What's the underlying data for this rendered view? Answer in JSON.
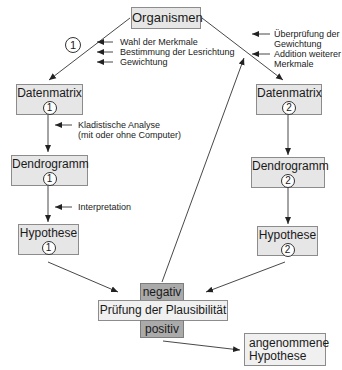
{
  "boxes": {
    "organismen": "Organismen",
    "datenmatrix1": {
      "label": "Datenmatrix",
      "num": "1"
    },
    "datenmatrix2": {
      "label": "Datenmatrix",
      "num": "2"
    },
    "dendrogramm1": {
      "label": "Dendrogramm",
      "num": "1"
    },
    "dendrogramm2": {
      "label": "Dendrogramm",
      "num": "2"
    },
    "hypothese1": {
      "label": "Hypothese",
      "num": "1"
    },
    "hypothese2": {
      "label": "Hypothese",
      "num": "2"
    },
    "negativ": "negativ",
    "pruefung": "Prüfung der Plausibilität",
    "positiv": "positiv",
    "angenommen": {
      "line1": "angenommene",
      "line2": "Hypothese"
    }
  },
  "path_marker": "1",
  "annotations": {
    "left_top": [
      "Wahl der Merkmale",
      "Bestimmung der Lesrichtung",
      "Gewichtung"
    ],
    "right_top": [
      "Überprüfung der",
      "Gewichtung",
      "Addition weiterer",
      "Merkmale"
    ],
    "kladistisch": [
      "Kladistische Analyse",
      "(mit oder ohne Computer)"
    ],
    "interpretation": "Interpretation"
  },
  "colors": {
    "box_fill": "#e6e6e6",
    "dark_fill": "#aaaaaa",
    "border": "#8c8c8c",
    "line": "#333333"
  }
}
